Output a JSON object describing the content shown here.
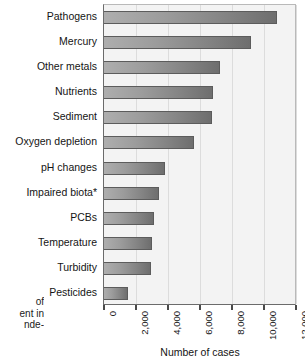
{
  "chart_data": {
    "type": "bar",
    "orientation": "horizontal",
    "title": "",
    "xlabel": "Number of cases",
    "ylabel": "",
    "categories": [
      "Pathogens",
      "Mercury",
      "Other metals",
      "Nutrients",
      "Sediment",
      "Oxygen depletion",
      "pH changes",
      "Impaired biota*",
      "PCBs",
      "Temperature",
      "Turbidity",
      "Pesticides"
    ],
    "values": [
      10800,
      9200,
      7250,
      6800,
      6750,
      5600,
      3800,
      3450,
      3150,
      3000,
      2950,
      1500
    ],
    "xlim": [
      0,
      12000
    ],
    "xticks": [
      0,
      2000,
      4000,
      6000,
      8000,
      10000,
      12000
    ],
    "xticklabels": [
      "0",
      "2,000",
      "4,000",
      "6,000",
      "8,000",
      "10,000",
      "12,000"
    ],
    "grid": "vertical",
    "legend": "none",
    "bar_color_start": "#aeaeae",
    "bar_color_end": "#6e6e6e",
    "plot_background": "#f3f3f3"
  },
  "caption": {
    "lines": [
      "of",
      "ent in",
      "nde-"
    ]
  }
}
